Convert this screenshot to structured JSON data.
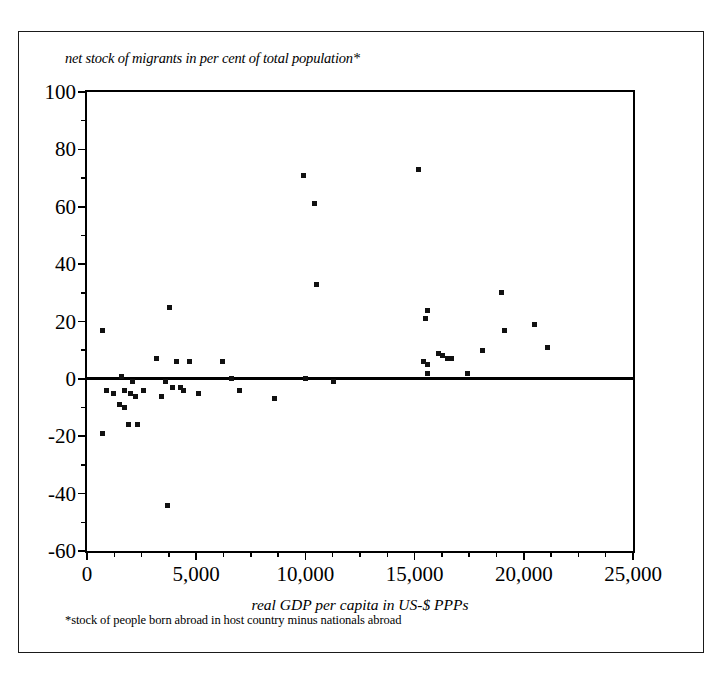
{
  "figure": {
    "title": "net stock of migrants in per cent of total population*",
    "footnote": "*stock of people born abroad in host country minus nationals abroad",
    "border_color": "#1a1a1a"
  },
  "chart_data": {
    "type": "scatter",
    "title": "net stock of migrants in per cent of total population*",
    "xlabel": "real GDP per capita in US-$ PPPs",
    "ylabel": "net stock of migrants in per cent of total population*",
    "footnote": "*stock of people born abroad in host country minus nationals abroad",
    "xlim": [
      0,
      25000
    ],
    "ylim": [
      -60,
      100
    ],
    "x_major_ticks": [
      0,
      5000,
      10000,
      15000,
      20000,
      25000
    ],
    "x_major_tick_labels": [
      "0",
      "5,000",
      "10,000",
      "15,000",
      "20,000",
      "25,000"
    ],
    "x_minor_tick_step": 1250,
    "y_major_ticks": [
      -60,
      -40,
      -20,
      0,
      20,
      40,
      60,
      80,
      100
    ],
    "y_major_tick_labels": [
      "-60",
      "-40",
      "-20",
      "0",
      "20",
      "40",
      "60",
      "80",
      "100"
    ],
    "y_minor_tick_step": 10,
    "grid": false,
    "legend": null,
    "marker": "square",
    "marker_color": "#111111",
    "zero_reference_line": 0,
    "series": [
      {
        "name": "countries",
        "points": [
          [
            700,
            17
          ],
          [
            700,
            -19
          ],
          [
            900,
            -4
          ],
          [
            1200,
            -5
          ],
          [
            1500,
            -9
          ],
          [
            1600,
            1
          ],
          [
            1700,
            -4
          ],
          [
            1700,
            -10
          ],
          [
            1900,
            -16
          ],
          [
            2000,
            -5
          ],
          [
            2100,
            -1
          ],
          [
            2200,
            -6
          ],
          [
            2300,
            -16
          ],
          [
            2600,
            -4
          ],
          [
            3200,
            7
          ],
          [
            3400,
            -6
          ],
          [
            3600,
            -1
          ],
          [
            3700,
            -44
          ],
          [
            3800,
            25
          ],
          [
            3900,
            -3
          ],
          [
            4100,
            6
          ],
          [
            4300,
            -3
          ],
          [
            4400,
            -4
          ],
          [
            4700,
            6
          ],
          [
            5100,
            -5
          ],
          [
            6200,
            6
          ],
          [
            6600,
            0
          ],
          [
            7000,
            -4
          ],
          [
            8600,
            -7
          ],
          [
            9900,
            71
          ],
          [
            10000,
            0
          ],
          [
            10400,
            61
          ],
          [
            10500,
            33
          ],
          [
            11300,
            -1
          ],
          [
            15200,
            73
          ],
          [
            15400,
            6
          ],
          [
            15500,
            21
          ],
          [
            15600,
            24
          ],
          [
            15600,
            5
          ],
          [
            15600,
            2
          ],
          [
            16100,
            9
          ],
          [
            16300,
            8
          ],
          [
            16500,
            7
          ],
          [
            16700,
            7
          ],
          [
            17400,
            2
          ],
          [
            18100,
            10
          ],
          [
            19000,
            30
          ],
          [
            19100,
            17
          ],
          [
            20500,
            19
          ],
          [
            21100,
            11
          ]
        ]
      }
    ]
  }
}
